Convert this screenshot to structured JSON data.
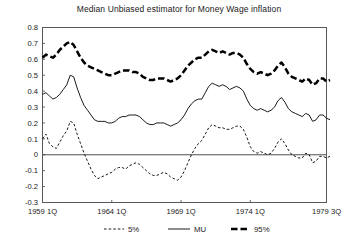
{
  "chart_data": {
    "type": "line",
    "title": "Median Unbiased estimator for Money Wage inflation",
    "xlabel": "",
    "ylabel": "",
    "ylim": [
      -0.3,
      0.8
    ],
    "ytick_values": [
      0.8,
      0.7,
      0.6,
      0.5,
      0.4,
      0.3,
      0.2,
      0.1,
      0,
      -0.1,
      -0.2,
      -0.3
    ],
    "ytick_labels": [
      "0.8",
      "0.7",
      "0.6",
      "0.5",
      "0.4",
      "0.3",
      "0.2",
      "0.1",
      "0",
      "-0.1",
      "-0.2",
      "-0.3"
    ],
    "xtick_labels": [
      "1959 1Q",
      "1964 1Q",
      "1969 1Q",
      "1974 1Q",
      "1979 3Q"
    ],
    "xtick_index": [
      0,
      20,
      40,
      60,
      82
    ],
    "xlim_index": [
      0,
      82
    ],
    "grid": false,
    "legend_position": "below-axes",
    "zero_line": 0,
    "series": [
      {
        "name": "5%",
        "style": "dashed-thin",
        "values": [
          0.1,
          0.13,
          0.07,
          0.05,
          0.04,
          0.08,
          0.12,
          0.15,
          0.21,
          0.2,
          0.13,
          0.07,
          0.01,
          -0.04,
          -0.09,
          -0.13,
          -0.15,
          -0.14,
          -0.13,
          -0.12,
          -0.11,
          -0.09,
          -0.08,
          -0.08,
          -0.09,
          -0.07,
          -0.06,
          -0.05,
          -0.06,
          -0.08,
          -0.1,
          -0.12,
          -0.13,
          -0.13,
          -0.12,
          -0.11,
          -0.12,
          -0.14,
          -0.15,
          -0.16,
          -0.14,
          -0.1,
          -0.05,
          0.0,
          0.04,
          0.07,
          0.09,
          0.13,
          0.17,
          0.19,
          0.18,
          0.17,
          0.17,
          0.16,
          0.16,
          0.17,
          0.18,
          0.18,
          0.16,
          0.11,
          0.05,
          0.02,
          0.01,
          0.02,
          0.01,
          0.0,
          0.01,
          0.04,
          0.08,
          0.1,
          0.07,
          0.03,
          0.0,
          -0.01,
          -0.02,
          -0.02,
          0.01,
          0.0,
          -0.05,
          -0.04,
          -0.01,
          -0.01,
          -0.02,
          -0.01
        ]
      },
      {
        "name": "MU",
        "style": "solid-thin",
        "values": [
          0.38,
          0.39,
          0.37,
          0.35,
          0.36,
          0.38,
          0.41,
          0.44,
          0.5,
          0.49,
          0.42,
          0.36,
          0.31,
          0.28,
          0.25,
          0.22,
          0.21,
          0.21,
          0.21,
          0.2,
          0.2,
          0.21,
          0.23,
          0.24,
          0.24,
          0.25,
          0.25,
          0.25,
          0.24,
          0.22,
          0.2,
          0.19,
          0.19,
          0.2,
          0.2,
          0.2,
          0.19,
          0.18,
          0.19,
          0.2,
          0.22,
          0.25,
          0.29,
          0.32,
          0.34,
          0.35,
          0.35,
          0.39,
          0.43,
          0.45,
          0.44,
          0.43,
          0.44,
          0.43,
          0.41,
          0.42,
          0.43,
          0.42,
          0.4,
          0.35,
          0.31,
          0.29,
          0.28,
          0.29,
          0.28,
          0.27,
          0.28,
          0.3,
          0.34,
          0.36,
          0.33,
          0.29,
          0.27,
          0.26,
          0.25,
          0.24,
          0.26,
          0.25,
          0.21,
          0.22,
          0.25,
          0.25,
          0.23,
          0.22
        ]
      },
      {
        "name": "95%",
        "style": "dashed-thick",
        "values": [
          0.61,
          0.63,
          0.62,
          0.61,
          0.63,
          0.66,
          0.68,
          0.7,
          0.71,
          0.69,
          0.65,
          0.61,
          0.58,
          0.56,
          0.55,
          0.54,
          0.53,
          0.52,
          0.51,
          0.5,
          0.5,
          0.51,
          0.52,
          0.53,
          0.53,
          0.53,
          0.52,
          0.52,
          0.51,
          0.49,
          0.48,
          0.47,
          0.47,
          0.48,
          0.48,
          0.48,
          0.47,
          0.46,
          0.47,
          0.48,
          0.5,
          0.53,
          0.56,
          0.58,
          0.6,
          0.61,
          0.61,
          0.63,
          0.65,
          0.66,
          0.65,
          0.64,
          0.65,
          0.64,
          0.63,
          0.64,
          0.64,
          0.63,
          0.61,
          0.57,
          0.54,
          0.52,
          0.51,
          0.52,
          0.51,
          0.5,
          0.51,
          0.53,
          0.56,
          0.58,
          0.55,
          0.51,
          0.49,
          0.48,
          0.47,
          0.46,
          0.48,
          0.47,
          0.44,
          0.45,
          0.48,
          0.48,
          0.46,
          0.47
        ]
      }
    ],
    "legend": [
      {
        "label": "5%",
        "style": "dashed-thin"
      },
      {
        "label": "MU",
        "style": "solid-thin"
      },
      {
        "label": "95%",
        "style": "dashed-thick"
      }
    ]
  },
  "colors": {
    "series": "#000000",
    "frame": "#555a5e",
    "text": "#1a1a1a",
    "background": "#ffffff"
  }
}
